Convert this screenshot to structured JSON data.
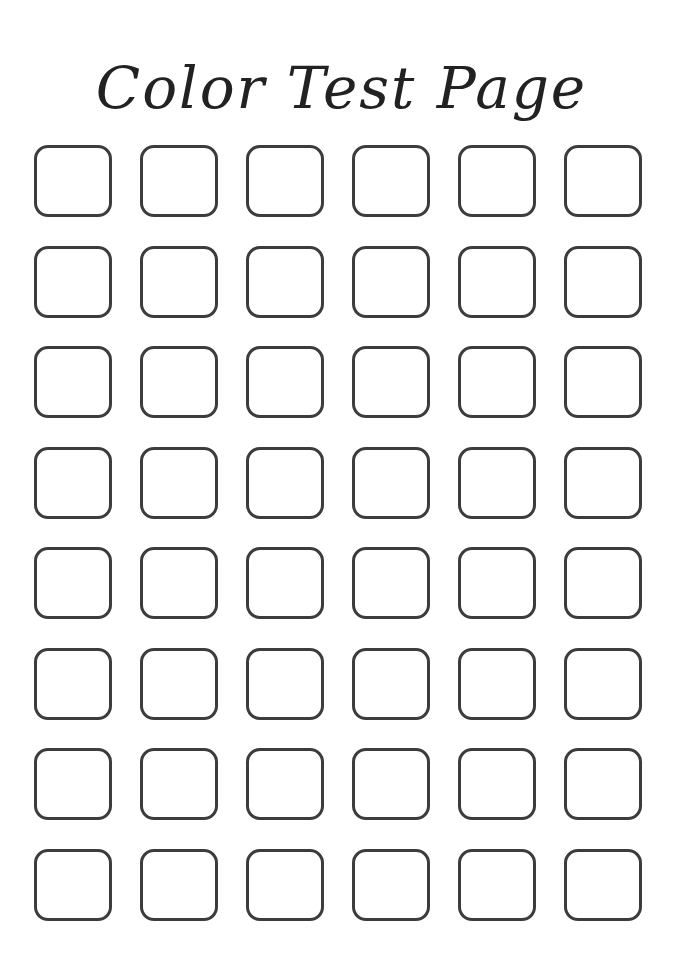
{
  "page": {
    "title": "Color Test Page"
  },
  "grid": {
    "rows": 8,
    "columns": 6,
    "swatches": [
      {
        "row": 1,
        "col": 1
      },
      {
        "row": 1,
        "col": 2
      },
      {
        "row": 1,
        "col": 3
      },
      {
        "row": 1,
        "col": 4
      },
      {
        "row": 1,
        "col": 5
      },
      {
        "row": 1,
        "col": 6
      },
      {
        "row": 2,
        "col": 1
      },
      {
        "row": 2,
        "col": 2
      },
      {
        "row": 2,
        "col": 3
      },
      {
        "row": 2,
        "col": 4
      },
      {
        "row": 2,
        "col": 5
      },
      {
        "row": 2,
        "col": 6
      },
      {
        "row": 3,
        "col": 1
      },
      {
        "row": 3,
        "col": 2
      },
      {
        "row": 3,
        "col": 3
      },
      {
        "row": 3,
        "col": 4
      },
      {
        "row": 3,
        "col": 5
      },
      {
        "row": 3,
        "col": 6
      },
      {
        "row": 4,
        "col": 1
      },
      {
        "row": 4,
        "col": 2
      },
      {
        "row": 4,
        "col": 3
      },
      {
        "row": 4,
        "col": 4
      },
      {
        "row": 4,
        "col": 5
      },
      {
        "row": 4,
        "col": 6
      },
      {
        "row": 5,
        "col": 1
      },
      {
        "row": 5,
        "col": 2
      },
      {
        "row": 5,
        "col": 3
      },
      {
        "row": 5,
        "col": 4
      },
      {
        "row": 5,
        "col": 5
      },
      {
        "row": 5,
        "col": 6
      },
      {
        "row": 6,
        "col": 1
      },
      {
        "row": 6,
        "col": 2
      },
      {
        "row": 6,
        "col": 3
      },
      {
        "row": 6,
        "col": 4
      },
      {
        "row": 6,
        "col": 5
      },
      {
        "row": 6,
        "col": 6
      },
      {
        "row": 7,
        "col": 1
      },
      {
        "row": 7,
        "col": 2
      },
      {
        "row": 7,
        "col": 3
      },
      {
        "row": 7,
        "col": 4
      },
      {
        "row": 7,
        "col": 5
      },
      {
        "row": 7,
        "col": 6
      },
      {
        "row": 8,
        "col": 1
      },
      {
        "row": 8,
        "col": 2
      },
      {
        "row": 8,
        "col": 3
      },
      {
        "row": 8,
        "col": 4
      },
      {
        "row": 8,
        "col": 5
      },
      {
        "row": 8,
        "col": 6
      }
    ]
  },
  "colors": {
    "outline": "#3c3c3c",
    "background": "#ffffff",
    "text": "#222222"
  }
}
